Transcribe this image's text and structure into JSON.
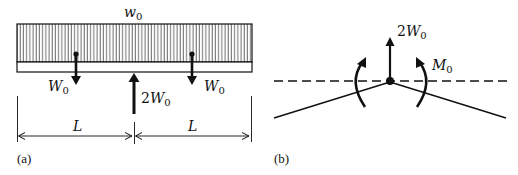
{
  "figure": {
    "panel_a": {
      "caption": "(a)",
      "distributed_load_label": "w",
      "distributed_load_sub": "0",
      "left_load": {
        "label": "W",
        "sub": "0"
      },
      "right_load": {
        "label": "W",
        "sub": "0"
      },
      "support_reaction": {
        "coef": "2",
        "label": "W",
        "sub": "0"
      },
      "dimensions": [
        {
          "label": "L"
        },
        {
          "label": "L"
        }
      ]
    },
    "panel_b": {
      "caption": "(b)",
      "reaction": {
        "coef": "2",
        "label": "W",
        "sub": "0"
      },
      "moment": {
        "label": "M",
        "sub": "0"
      }
    },
    "colors": {
      "ink": "#111111",
      "background": "#ffffff"
    }
  }
}
